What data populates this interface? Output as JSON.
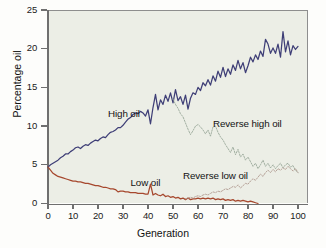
{
  "chart_data": {
    "type": "line",
    "title": "",
    "xlabel": "Generation",
    "ylabel": "Percentage oil",
    "xlim": [
      0,
      104
    ],
    "ylim": [
      0,
      25
    ],
    "xticks": [
      0,
      10,
      20,
      30,
      40,
      50,
      60,
      70,
      80,
      90,
      100
    ],
    "xtick_labels": [
      "0",
      "10",
      "20",
      "30",
      "40",
      "50",
      "60",
      "70",
      "80",
      "90",
      "100"
    ],
    "yticks": [
      0,
      5,
      10,
      15,
      20,
      25
    ],
    "ytick_labels": [
      "0",
      "5",
      "10",
      "15",
      "20",
      "25"
    ],
    "grid": false,
    "legend_position": "inline-annotations",
    "background": "#eceee6",
    "series": [
      {
        "name": "High oil",
        "color": "#3f3f77",
        "style": "solid",
        "label_x": 24,
        "label_y": 11.6,
        "x": [
          0,
          1,
          2,
          3,
          4,
          5,
          6,
          7,
          8,
          9,
          10,
          11,
          12,
          13,
          14,
          15,
          16,
          17,
          18,
          19,
          20,
          21,
          22,
          23,
          24,
          25,
          26,
          27,
          28,
          29,
          30,
          31,
          32,
          33,
          34,
          35,
          36,
          37,
          38,
          39,
          40,
          41,
          42,
          43,
          44,
          45,
          46,
          47,
          48,
          49,
          50,
          51,
          52,
          53,
          54,
          55,
          56,
          57,
          58,
          59,
          60,
          61,
          62,
          63,
          64,
          65,
          66,
          67,
          68,
          69,
          70,
          71,
          72,
          73,
          74,
          75,
          76,
          77,
          78,
          79,
          80,
          81,
          82,
          83,
          84,
          85,
          86,
          87,
          88,
          89,
          90,
          91,
          92,
          93,
          94,
          95,
          96,
          97,
          98,
          99,
          100
        ],
        "y": [
          4.7,
          5.0,
          5.2,
          5.4,
          5.6,
          5.9,
          6.1,
          6.4,
          6.4,
          6.7,
          6.9,
          7.2,
          7.3,
          7.1,
          7.4,
          7.6,
          7.5,
          7.8,
          8.0,
          8.2,
          8.1,
          8.4,
          8.6,
          8.5,
          8.9,
          9.2,
          9.3,
          9.5,
          9.8,
          9.8,
          10.1,
          10.5,
          10.9,
          11.1,
          11.5,
          11.7,
          11.6,
          11.9,
          11.7,
          11.3,
          12.1,
          10.3,
          12.4,
          14.1,
          12.1,
          13.4,
          12.8,
          14.0,
          13.2,
          14.3,
          13.0,
          14.7,
          13.3,
          13.8,
          12.8,
          14.0,
          12.2,
          13.6,
          14.3,
          14.1,
          15.0,
          14.6,
          15.6,
          15.2,
          16.0,
          15.3,
          16.5,
          15.8,
          17.1,
          16.3,
          17.6,
          16.4,
          17.4,
          16.7,
          17.9,
          17.2,
          18.5,
          17.4,
          18.2,
          16.9,
          17.8,
          18.9,
          18.3,
          19.2,
          18.6,
          19.7,
          19.0,
          21.2,
          20.6,
          19.4,
          20.1,
          19.4,
          20.6,
          18.9,
          22.2,
          19.6,
          21.0,
          19.2,
          20.4,
          19.9,
          20.3
        ]
      },
      {
        "name": "Low oil",
        "color": "#a6482e",
        "style": "solid",
        "label_x": 33,
        "label_y": 2.6,
        "x": [
          0,
          1,
          2,
          3,
          4,
          5,
          6,
          7,
          8,
          9,
          10,
          11,
          12,
          13,
          14,
          15,
          16,
          17,
          18,
          19,
          20,
          21,
          22,
          23,
          24,
          25,
          26,
          27,
          28,
          29,
          30,
          31,
          32,
          33,
          34,
          35,
          36,
          37,
          38,
          39,
          40,
          41,
          42,
          43,
          44,
          45,
          46,
          47,
          48,
          49,
          50,
          51,
          52,
          53,
          54,
          55,
          56,
          57,
          58,
          59,
          60,
          61,
          62,
          63,
          64,
          65,
          66,
          67,
          68,
          69,
          70,
          71,
          72,
          73,
          74,
          75,
          76,
          77,
          78,
          79,
          80,
          81,
          82,
          83,
          84
        ],
        "y": [
          4.7,
          4.3,
          3.9,
          3.7,
          3.5,
          3.4,
          3.3,
          3.2,
          3.1,
          3.0,
          2.9,
          2.9,
          2.8,
          2.8,
          2.7,
          2.6,
          2.6,
          2.5,
          2.4,
          2.3,
          2.3,
          2.2,
          2.1,
          2.1,
          2.0,
          1.9,
          1.9,
          1.8,
          1.5,
          1.6,
          1.6,
          1.5,
          1.5,
          1.4,
          1.4,
          1.4,
          1.3,
          1.3,
          1.3,
          1.2,
          1.2,
          2.5,
          1.1,
          1.3,
          1.1,
          1.0,
          1.2,
          0.9,
          1.0,
          0.8,
          0.9,
          0.7,
          0.8,
          0.6,
          0.7,
          0.5,
          0.7,
          0.5,
          0.6,
          0.6,
          0.7,
          0.6,
          0.7,
          0.6,
          0.7,
          0.6,
          0.7,
          0.5,
          0.6,
          0.5,
          0.6,
          0.4,
          0.5,
          0.4,
          0.5,
          0.3,
          0.4,
          0.3,
          0.4,
          0.3,
          0.2,
          0.3,
          0.2,
          0.1,
          0.0
        ]
      },
      {
        "name": "Reverse high oil",
        "color": "#9aa89a",
        "style": "dashed",
        "label_x": 66,
        "label_y": 10.3,
        "x": [
          50,
          51,
          52,
          53,
          54,
          55,
          56,
          57,
          58,
          59,
          60,
          61,
          62,
          63,
          64,
          65,
          66,
          67,
          68,
          69,
          70,
          71,
          72,
          73,
          74,
          75,
          76,
          77,
          78,
          79,
          80,
          81,
          82,
          83,
          84,
          85,
          86,
          87,
          88,
          89,
          90,
          91,
          92,
          93,
          94,
          95,
          96,
          97,
          98,
          99,
          100
        ],
        "y": [
          13.5,
          12.8,
          12.3,
          11.6,
          11.2,
          10.4,
          9.6,
          8.9,
          9.4,
          10.0,
          10.2,
          9.9,
          9.5,
          9.0,
          9.5,
          8.7,
          9.9,
          10.0,
          9.2,
          8.6,
          8.2,
          7.6,
          7.1,
          6.6,
          7.3,
          6.3,
          7.0,
          6.0,
          6.4,
          5.6,
          6.0,
          5.4,
          4.8,
          5.2,
          4.5,
          5.0,
          5.6,
          4.8,
          5.2,
          4.6,
          5.0,
          4.5,
          4.9,
          5.2,
          4.6,
          5.0,
          5.2,
          4.7,
          4.9,
          4.3,
          4.0
        ]
      },
      {
        "name": "Reverse low oil",
        "color": "#b09a90",
        "style": "dashed",
        "label_x": 54,
        "label_y": 3.5,
        "x": [
          55,
          56,
          57,
          58,
          59,
          60,
          61,
          62,
          63,
          64,
          65,
          66,
          67,
          68,
          69,
          70,
          71,
          72,
          73,
          74,
          75,
          76,
          77,
          78,
          79,
          80,
          81,
          82,
          83,
          84,
          85,
          86,
          87,
          88,
          89,
          90,
          91,
          92,
          93,
          94,
          95,
          96,
          97,
          98,
          99,
          100
        ],
        "y": [
          0.6,
          0.7,
          0.8,
          0.7,
          0.9,
          1.0,
          0.9,
          1.1,
          1.2,
          1.1,
          1.3,
          1.5,
          1.4,
          1.6,
          1.5,
          1.7,
          1.9,
          1.8,
          2.0,
          2.2,
          2.1,
          2.4,
          2.0,
          2.3,
          2.6,
          2.5,
          2.9,
          3.2,
          3.0,
          3.4,
          3.8,
          3.5,
          4.0,
          4.3,
          4.0,
          4.4,
          4.1,
          4.5,
          4.3,
          4.6,
          4.4,
          4.8,
          4.5,
          4.2,
          4.5,
          4.0
        ]
      }
    ]
  },
  "labels": {
    "high_oil": "High oil",
    "low_oil": "Low oil",
    "reverse_high_oil": "Reverse high oil",
    "reverse_low_oil": "Reverse low oil"
  }
}
